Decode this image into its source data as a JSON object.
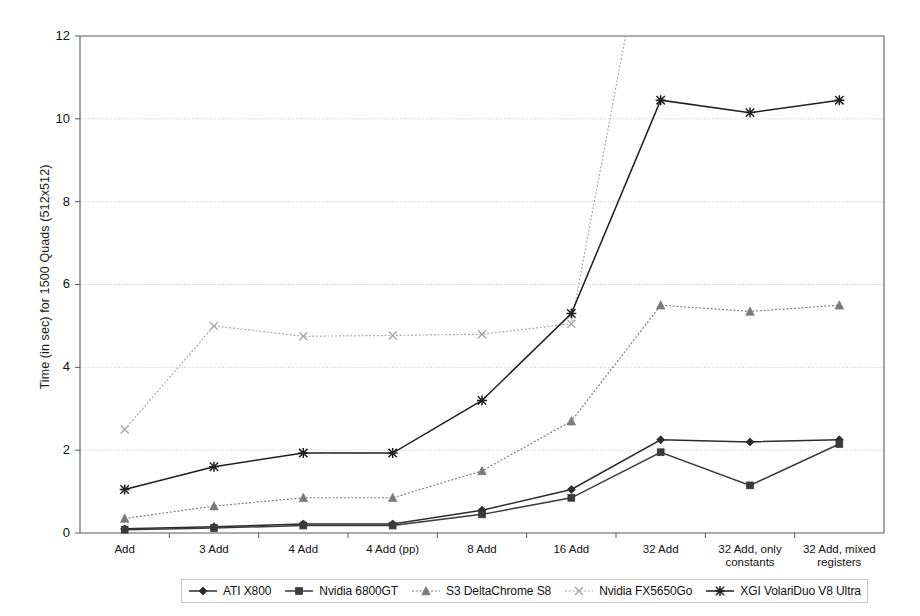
{
  "chart_data": {
    "type": "line",
    "title": "",
    "xlabel": "",
    "ylabel": "Time (in sec) for 1500 Quads (512x512)",
    "ylim": [
      0,
      12
    ],
    "ytick_labels": [
      "0",
      "2",
      "4",
      "6",
      "8",
      "10",
      "12"
    ],
    "yticks": [
      0,
      2,
      4,
      6,
      8,
      10,
      12
    ],
    "grid": "horizontal-dotted",
    "legend_position": "bottom",
    "categories": [
      "Add",
      "3 Add",
      "4 Add",
      "4 Add (pp)",
      "8 Add",
      "16 Add",
      "32 Add",
      "32 Add, only constants",
      "32 Add, mixed registers"
    ],
    "category_label_lines": [
      [
        "Add"
      ],
      [
        "3 Add"
      ],
      [
        "4 Add"
      ],
      [
        "4 Add (pp)"
      ],
      [
        "8 Add"
      ],
      [
        "16 Add"
      ],
      [
        "32 Add"
      ],
      [
        "32 Add, only",
        "constants"
      ],
      [
        "32 Add, mixed",
        "registers"
      ]
    ],
    "series": [
      {
        "name": "ATI X800",
        "marker": "diamond",
        "color": "#2c2c2c",
        "linestyle": "solid",
        "values": [
          0.1,
          0.15,
          0.22,
          0.22,
          0.55,
          1.05,
          2.25,
          2.2,
          2.25
        ]
      },
      {
        "name": "Nvidia 6800GT",
        "marker": "square",
        "color": "#3a3a3a",
        "linestyle": "solid",
        "values": [
          0.08,
          0.12,
          0.18,
          0.18,
          0.45,
          0.85,
          1.95,
          1.15,
          2.15
        ]
      },
      {
        "name": "S3 DeltaChrome S8",
        "marker": "triangle",
        "color": "#7b7b7b",
        "linestyle": "dotted",
        "values": [
          0.35,
          0.65,
          0.85,
          0.85,
          1.5,
          2.7,
          5.5,
          5.35,
          5.5
        ]
      },
      {
        "name": "Nvidia FX5650Go",
        "marker": "cross",
        "color": "#a8a8a8",
        "linestyle": "dotted",
        "values": [
          2.5,
          5.0,
          4.75,
          4.77,
          4.8,
          5.05,
          16.5,
          null,
          null
        ],
        "note": "exceeds axis maximum at 32 Add; line runs off the top of the plot"
      },
      {
        "name": "XGI VolariDuo V8 Ultra",
        "marker": "asterisk",
        "color": "#1f1f1f",
        "linestyle": "solid",
        "values": [
          1.05,
          1.6,
          1.93,
          1.93,
          3.2,
          5.3,
          10.45,
          10.15,
          10.45
        ]
      }
    ]
  },
  "legend": {
    "items": [
      {
        "label": "ATI X800"
      },
      {
        "label": "Nvidia 6800GT"
      },
      {
        "label": "S3 DeltaChrome S8"
      },
      {
        "label": "Nvidia FX5650Go"
      },
      {
        "label": "XGI VolariDuo V8 Ultra"
      }
    ]
  }
}
